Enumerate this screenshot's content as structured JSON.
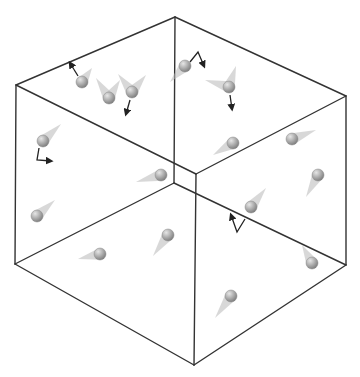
{
  "figure": {
    "width": 360,
    "height": 377,
    "colors": {
      "background": "#ffffff",
      "edge": "#333333",
      "particle_light": "#e6e6e6",
      "particle_dark": "#7a7a7a",
      "trail": "#b8b8b8",
      "arrow": "#222222"
    }
  },
  "cube": {
    "vertices": {
      "back_top": [
        175,
        17
      ],
      "left_top": [
        16,
        85
      ],
      "right_top": [
        346,
        96
      ],
      "front_top": [
        196,
        174
      ],
      "back_bottom": [
        174,
        183
      ],
      "left_bottom": [
        15,
        264
      ],
      "right_bottom": [
        346,
        265
      ],
      "front_bottom": [
        194,
        365
      ]
    },
    "edges": [
      [
        "back_top",
        "left_top"
      ],
      [
        "back_top",
        "right_top"
      ],
      [
        "left_top",
        "front_top"
      ],
      [
        "right_top",
        "front_top"
      ],
      [
        "back_top",
        "back_bottom"
      ],
      [
        "left_top",
        "left_bottom"
      ],
      [
        "right_top",
        "right_bottom"
      ],
      [
        "front_top",
        "front_bottom"
      ],
      [
        "back_bottom",
        "left_bottom"
      ],
      [
        "back_bottom",
        "right_bottom"
      ],
      [
        "left_bottom",
        "front_bottom"
      ],
      [
        "right_bottom",
        "front_bottom"
      ]
    ]
  },
  "particles": [
    {
      "x": 82,
      "y": 82,
      "trails": [
        [
          92,
          68
        ]
      ],
      "arrow": [
        [
          78,
          76
        ],
        [
          70,
          63
        ]
      ]
    },
    {
      "x": 109,
      "y": 98,
      "trails": [
        [
          96,
          78
        ],
        [
          120,
          80
        ]
      ],
      "arrow": null
    },
    {
      "x": 132,
      "y": 92,
      "trails": [
        [
          118,
          74
        ],
        [
          146,
          75
        ]
      ],
      "arrow": [
        [
          130,
          100
        ],
        [
          126,
          114
        ]
      ]
    },
    {
      "x": 185,
      "y": 66,
      "trails": [
        [
          170,
          82
        ]
      ],
      "arrow": [
        [
          190,
          62
        ],
        [
          198,
          52
        ],
        [
          204,
          66
        ]
      ]
    },
    {
      "x": 229,
      "y": 87,
      "trails": [
        [
          205,
          80
        ],
        [
          236,
          66
        ]
      ],
      "arrow": [
        [
          230,
          95
        ],
        [
          232,
          109
        ]
      ]
    },
    {
      "x": 43,
      "y": 141,
      "trails": [
        [
          61,
          124
        ]
      ],
      "arrow": [
        [
          39,
          148
        ],
        [
          37,
          160
        ],
        [
          51,
          161
        ]
      ]
    },
    {
      "x": 161,
      "y": 175,
      "trails": [
        [
          136,
          182
        ]
      ],
      "arrow": null
    },
    {
      "x": 233,
      "y": 143,
      "trails": [
        [
          213,
          155
        ]
      ],
      "arrow": null
    },
    {
      "x": 292,
      "y": 139,
      "trails": [
        [
          316,
          130
        ]
      ],
      "arrow": null
    },
    {
      "x": 318,
      "y": 175,
      "trails": [
        [
          306,
          197
        ]
      ],
      "arrow": null
    },
    {
      "x": 37,
      "y": 216,
      "trails": [
        [
          55,
          200
        ]
      ],
      "arrow": null
    },
    {
      "x": 100,
      "y": 254,
      "trails": [
        [
          78,
          259
        ]
      ],
      "arrow": null
    },
    {
      "x": 168,
      "y": 235,
      "trails": [
        [
          153,
          256
        ]
      ],
      "arrow": null
    },
    {
      "x": 251,
      "y": 207,
      "trails": [
        [
          266,
          188
        ]
      ],
      "arrow": [
        [
          245,
          219
        ],
        [
          237,
          232
        ],
        [
          231,
          215
        ]
      ]
    },
    {
      "x": 312,
      "y": 263,
      "trails": [
        [
          302,
          245
        ]
      ],
      "arrow": null
    },
    {
      "x": 231,
      "y": 296,
      "trails": [
        [
          215,
          318
        ]
      ],
      "arrow": null
    }
  ]
}
